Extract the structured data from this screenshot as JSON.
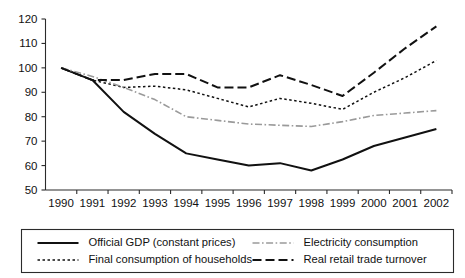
{
  "chart_data": {
    "type": "line",
    "title": "",
    "xlabel": "",
    "ylabel": "",
    "x": [
      1990,
      1991,
      1992,
      1993,
      1994,
      1995,
      1996,
      1997,
      1998,
      1999,
      2000,
      2001,
      2002
    ],
    "xtick_labels": [
      "1990",
      "1991",
      "1992",
      "1993",
      "1994",
      "1995",
      "1996",
      "1997",
      "1998",
      "1999",
      "2000",
      "2001",
      "2002"
    ],
    "ytick_labels": [
      "50",
      "60",
      "70",
      "80",
      "90",
      "100",
      "110",
      "120"
    ],
    "yticks": [
      50,
      60,
      70,
      80,
      90,
      100,
      110,
      120
    ],
    "ylim": [
      50,
      120
    ],
    "xlim": [
      1990,
      2002
    ],
    "grid": false,
    "legend_position": "bottom",
    "series": [
      {
        "name": "Official GDP (constant prices)",
        "style": "solid",
        "color": "#111111",
        "width": 2.0,
        "dash": "none",
        "values": [
          100,
          95,
          82,
          73,
          65,
          62.5,
          60,
          61,
          58,
          62.5,
          68,
          71.5,
          75
        ]
      },
      {
        "name": "Final consumption of households",
        "style": "dotted",
        "color": "#111111",
        "width": 1.5,
        "dash": "2.5,2.5",
        "values": [
          100,
          95,
          92,
          92.5,
          91,
          87.5,
          84,
          87.5,
          85.5,
          83,
          90,
          96,
          103
        ]
      },
      {
        "name": "Electricity consumption",
        "style": "dash-dot",
        "color": "#9a9a9a",
        "width": 1.6,
        "dash": "7,2.5,1.6,2.5",
        "values": [
          100,
          96.5,
          92,
          87,
          80,
          78.5,
          77,
          76.5,
          76,
          78,
          80.5,
          81.5,
          82.5
        ]
      },
      {
        "name": "Real retail trade turnover",
        "style": "dashed",
        "color": "#111111",
        "width": 2.0,
        "dash": "9,4",
        "values": [
          100,
          95,
          95,
          97.5,
          97.5,
          92,
          92,
          97,
          93,
          88.5,
          98,
          108,
          117
        ]
      }
    ],
    "legend_entries": [
      {
        "label": "Official GDP (constant prices)",
        "style": "solid",
        "color": "#111111"
      },
      {
        "label": "Electricity consumption",
        "style": "dash-dot",
        "color": "#9a9a9a"
      },
      {
        "label": "Final consumption of households",
        "style": "dotted",
        "color": "#111111"
      },
      {
        "label": "Real retail trade turnover",
        "style": "dashed",
        "color": "#111111"
      }
    ]
  },
  "colors": {
    "background": "#ffffff",
    "axis": "#2b2b2b",
    "text": "#111111",
    "grey_series": "#9a9a9a"
  }
}
